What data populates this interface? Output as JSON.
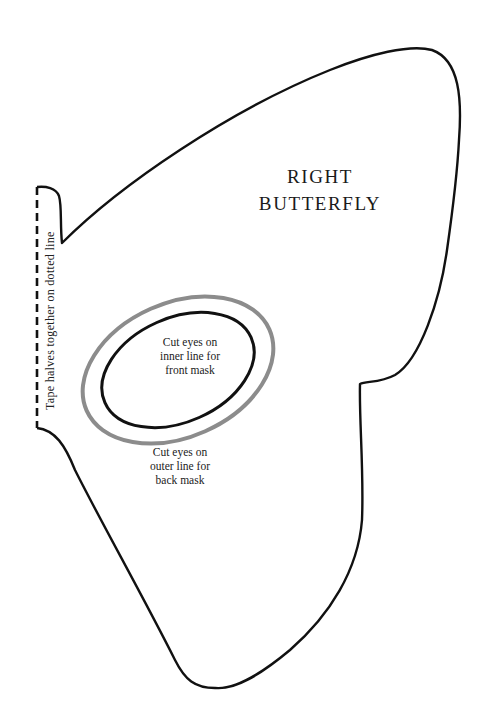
{
  "template": {
    "title_lines": [
      "RIGHT",
      "BUTTERFLY"
    ],
    "inner_eye_note_lines": [
      "Cut eyes on",
      "inner line for",
      "front mask"
    ],
    "outer_eye_note_lines": [
      "Cut eyes on",
      "outer line for",
      "back mask"
    ],
    "fold_line_label": "Tape  halves together on dotted line"
  },
  "colors": {
    "outline": "#111111",
    "outer_eye_line": "#8c8c8c",
    "inner_eye_line": "#111111",
    "background": "#ffffff",
    "text": "#1a1a1a"
  },
  "icons": {
    "dashed_fold_line": "dashed-line",
    "mask_outline": "butterfly-wing-outline",
    "outer_eye": "ellipse",
    "inner_eye": "ellipse"
  }
}
